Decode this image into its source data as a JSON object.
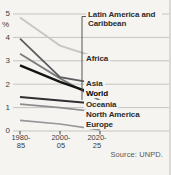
{
  "chart_data": {
    "type": "line",
    "unit_label": "%",
    "ylim": [
      0,
      5
    ],
    "y_ticks": [
      5,
      4,
      3,
      2,
      1,
      0
    ],
    "grid": true,
    "categories": [
      "1980-85",
      "2000-05",
      "2020-25"
    ],
    "x_tick_lines": [
      {
        "line1": "1980-",
        "line2": "85"
      },
      {
        "line1": "2000-",
        "line2": "05"
      },
      {
        "line1": "2020-",
        "line2": "25"
      }
    ],
    "legend_position": "right-of-lines",
    "series": [
      {
        "name": "Africa",
        "values": [
          4.85,
          3.65,
          3.1
        ],
        "color": "#c9c7c0",
        "width": 2.0
      },
      {
        "name": "Europe",
        "values": [
          0.45,
          0.3,
          0.05
        ],
        "color": "#97979a",
        "width": 1.7
      },
      {
        "name": "North America",
        "values": [
          1.15,
          1.0,
          0.8
        ],
        "color": "#8e8e90",
        "width": 1.7
      },
      {
        "name": "Latin America and Caribbean",
        "values": [
          3.3,
          2.25,
          1.3
        ],
        "color": "#7c7c7e",
        "width": 1.8
      },
      {
        "name": "Asia",
        "values": [
          3.95,
          2.3,
          2.0
        ],
        "color": "#5d5d5f",
        "width": 1.8
      },
      {
        "name": "Oceania",
        "values": [
          1.45,
          1.3,
          1.15
        ],
        "color": "#303032",
        "width": 2.0
      },
      {
        "name": "World",
        "values": [
          2.8,
          2.1,
          1.5
        ],
        "color": "#141414",
        "width": 2.4,
        "bold": true
      }
    ],
    "source": "Source: UNPD."
  },
  "colors": {
    "background": "#f5f4f1",
    "gridline": "#c4c4c0",
    "connector": "#555555",
    "tick_text": "#3c3c3c"
  }
}
